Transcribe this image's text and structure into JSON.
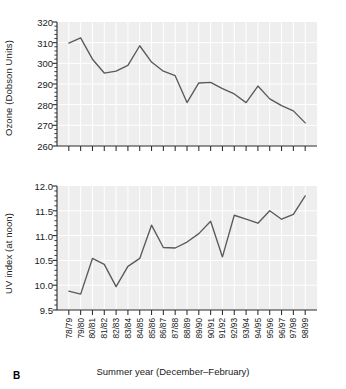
{
  "figure": {
    "panel_letter": "B",
    "xaxis_title": "Summer year (December–February)",
    "line_color": "#5a5a5a",
    "panel_background": "#eeeeee",
    "gridline_color": "#ffffff",
    "axis_color": "#2b2b2b"
  },
  "chart_data": [
    {
      "type": "line",
      "title": "",
      "xlabel": "Summer year (December–February)",
      "ylabel": "Ozone (Dobson Units)",
      "ylim": [
        260,
        320
      ],
      "yticks": [
        260,
        270,
        280,
        290,
        300,
        310,
        320
      ],
      "ytick_labels": [
        "260",
        "270",
        "280",
        "290",
        "300",
        "310",
        "320"
      ],
      "minor_tick_interval": 2,
      "grid": true,
      "legend": "none",
      "categories": [
        "78/79",
        "79/80",
        "80/81",
        "81/82",
        "82/83",
        "83/84",
        "84/85",
        "85/86",
        "86/87",
        "87/88",
        "88/89",
        "89/90",
        "90/91",
        "91/92",
        "92/93",
        "93/94",
        "94/95",
        "95/96",
        "96/97",
        "97/98",
        "98/99"
      ],
      "values": [
        309.8,
        312.3,
        302.0,
        295.3,
        296.2,
        299.0,
        308.5,
        300.6,
        296.2,
        294.0,
        281.0,
        290.5,
        290.8,
        287.8,
        285.2,
        281.0,
        289.0,
        282.8,
        279.5,
        277.0,
        271.2
      ]
    },
    {
      "type": "line",
      "title": "",
      "xlabel": "Summer year (December–February)",
      "ylabel": "UV index (at noon)",
      "ylim": [
        9.5,
        12.0
      ],
      "yticks": [
        9.5,
        10.0,
        10.5,
        11.0,
        11.5,
        12.0
      ],
      "ytick_labels": [
        "9.5",
        "10.0",
        "10.5",
        "11.0",
        "11.5",
        "12.0"
      ],
      "minor_tick_interval": 0.1,
      "grid": true,
      "legend": "none",
      "categories": [
        "78/79",
        "79/80",
        "80/81",
        "81/82",
        "82/83",
        "83/84",
        "84/85",
        "85/86",
        "86/87",
        "87/88",
        "88/89",
        "89/90",
        "90/91",
        "91/92",
        "92/93",
        "93/94",
        "94/95",
        "95/96",
        "96/97",
        "97/98",
        "98/99"
      ],
      "values": [
        9.88,
        9.82,
        10.54,
        10.42,
        9.97,
        10.38,
        10.54,
        11.21,
        10.76,
        10.75,
        10.87,
        11.04,
        11.29,
        10.57,
        11.41,
        11.33,
        11.25,
        11.5,
        11.33,
        11.43,
        11.8
      ]
    }
  ]
}
